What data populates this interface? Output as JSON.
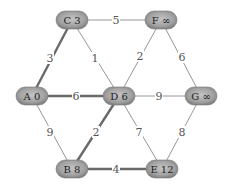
{
  "diagram": {
    "type": "weighted-graph-shortest-path",
    "nodes": [
      {
        "id": "C",
        "dist": "3",
        "label": "C 3",
        "x": 72,
        "y": 20
      },
      {
        "id": "F",
        "dist": "∞",
        "label": "F ∞",
        "x": 161,
        "y": 20
      },
      {
        "id": "A",
        "dist": "0",
        "label": "A 0",
        "x": 32,
        "y": 96
      },
      {
        "id": "D",
        "dist": "6",
        "label": "D 6",
        "x": 119,
        "y": 96
      },
      {
        "id": "G",
        "dist": "∞",
        "label": "G ∞",
        "x": 201,
        "y": 96
      },
      {
        "id": "B",
        "dist": "8",
        "label": "B 8",
        "x": 72,
        "y": 169
      },
      {
        "id": "E",
        "dist": "12",
        "label": "E 12",
        "x": 162,
        "y": 169
      }
    ],
    "edges": [
      {
        "from": "C",
        "to": "F",
        "weight": "5",
        "highlighted": false,
        "lx": 116,
        "ly": 20
      },
      {
        "from": "C",
        "to": "A",
        "weight": "3",
        "highlighted": true,
        "lx": 50,
        "ly": 58
      },
      {
        "from": "C",
        "to": "D",
        "weight": "1",
        "highlighted": false,
        "lx": 95,
        "ly": 58
      },
      {
        "from": "F",
        "to": "D",
        "weight": "2",
        "highlighted": false,
        "lx": 140,
        "ly": 56
      },
      {
        "from": "F",
        "to": "G",
        "weight": "6",
        "highlighted": false,
        "lx": 182,
        "ly": 57
      },
      {
        "from": "A",
        "to": "D",
        "weight": "6",
        "highlighted": true,
        "lx": 76,
        "ly": 96
      },
      {
        "from": "D",
        "to": "G",
        "weight": "9",
        "highlighted": false,
        "lx": 159,
        "ly": 96
      },
      {
        "from": "A",
        "to": "B",
        "weight": "9",
        "highlighted": false,
        "lx": 50,
        "ly": 132
      },
      {
        "from": "D",
        "to": "B",
        "weight": "2",
        "highlighted": true,
        "lx": 96,
        "ly": 132
      },
      {
        "from": "D",
        "to": "E",
        "weight": "7",
        "highlighted": false,
        "lx": 139,
        "ly": 132
      },
      {
        "from": "G",
        "to": "E",
        "weight": "8",
        "highlighted": false,
        "lx": 182,
        "ly": 132
      },
      {
        "from": "B",
        "to": "E",
        "weight": "4",
        "highlighted": true,
        "lx": 116,
        "ly": 169
      }
    ],
    "colors": {
      "node_fill_light": "#b8b8b8",
      "node_fill_dark": "#6e6e6e",
      "node_text": "#222222",
      "edge_thin": "#8a8a8a",
      "edge_thick": "#6a6a6a"
    }
  }
}
